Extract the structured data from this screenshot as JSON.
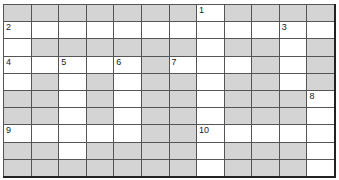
{
  "puzzle": {
    "rows": 10,
    "cols": 12,
    "colors": {
      "shaded": "#bdbdbd",
      "white": "#ffffff",
      "line": "#555555"
    },
    "grid": [
      [
        "S",
        "S",
        "S",
        "S",
        "S",
        "S",
        "S",
        "W",
        "S",
        "S",
        "S",
        "S"
      ],
      [
        "W",
        "W",
        "W",
        "W",
        "W",
        "W",
        "W",
        "W",
        "W",
        "W",
        "W",
        "W"
      ],
      [
        "W",
        "S",
        "S",
        "S",
        "S",
        "S",
        "S",
        "W",
        "S",
        "S",
        "W",
        "S"
      ],
      [
        "W",
        "W",
        "W",
        "W",
        "W",
        "S",
        "W",
        "W",
        "W",
        "S",
        "W",
        "S"
      ],
      [
        "W",
        "S",
        "W",
        "S",
        "W",
        "S",
        "S",
        "W",
        "S",
        "S",
        "W",
        "S"
      ],
      [
        "S",
        "S",
        "W",
        "S",
        "W",
        "S",
        "S",
        "W",
        "S",
        "S",
        "S",
        "W"
      ],
      [
        "S",
        "S",
        "W",
        "S",
        "W",
        "S",
        "S",
        "W",
        "S",
        "S",
        "S",
        "W"
      ],
      [
        "W",
        "W",
        "W",
        "W",
        "W",
        "S",
        "S",
        "W",
        "W",
        "W",
        "W",
        "W"
      ],
      [
        "S",
        "S",
        "W",
        "S",
        "S",
        "S",
        "S",
        "W",
        "S",
        "S",
        "S",
        "W"
      ],
      [
        "S",
        "S",
        "S",
        "S",
        "S",
        "S",
        "S",
        "W",
        "S",
        "S",
        "S",
        "W"
      ]
    ],
    "numbers": [
      {
        "label": "1",
        "row": 0,
        "col": 7
      },
      {
        "label": "2",
        "row": 1,
        "col": 0
      },
      {
        "label": "3",
        "row": 1,
        "col": 10
      },
      {
        "label": "4",
        "row": 3,
        "col": 0
      },
      {
        "label": "5",
        "row": 3,
        "col": 2
      },
      {
        "label": "6",
        "row": 3,
        "col": 4
      },
      {
        "label": "7",
        "row": 3,
        "col": 6
      },
      {
        "label": "8",
        "row": 5,
        "col": 11
      },
      {
        "label": "9",
        "row": 7,
        "col": 0
      },
      {
        "label": "10",
        "row": 7,
        "col": 7
      }
    ]
  }
}
